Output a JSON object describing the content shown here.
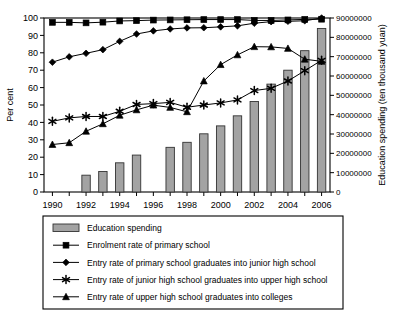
{
  "chart_data": {
    "type": "bar",
    "title": "",
    "subtitle": "",
    "xlabel": "",
    "ylabel": "Per cent",
    "y2label": "Education spending (ten thousand yuan)",
    "grid": false,
    "legend_position": "below",
    "x": [
      1990,
      1991,
      1992,
      1993,
      1994,
      1995,
      1996,
      1997,
      1998,
      1999,
      2000,
      2001,
      2002,
      2003,
      2004,
      2005,
      2006
    ],
    "xtick_labels": [
      "1990",
      "1992",
      "1994",
      "1996",
      "1998",
      "2000",
      "2002",
      "2004",
      "2006"
    ],
    "xticks": [
      1990,
      1992,
      1994,
      1996,
      1998,
      2000,
      2002,
      2004,
      2006
    ],
    "ylim": [
      0,
      100
    ],
    "yticks": [
      0,
      10,
      20,
      30,
      40,
      50,
      60,
      70,
      80,
      90,
      100
    ],
    "ytick_labels": [
      "0",
      "10",
      "20",
      "30",
      "40",
      "50",
      "60",
      "70",
      "80",
      "90",
      "100"
    ],
    "y2lim": [
      0,
      90000000
    ],
    "y2ticks": [
      0,
      10000000,
      20000000,
      30000000,
      40000000,
      50000000,
      60000000,
      70000000,
      80000000,
      90000000
    ],
    "y2tick_labels": [
      "0",
      "10000000",
      "20000000",
      "30000000",
      "40000000",
      "50000000",
      "60000000",
      "70000000",
      "80000000",
      "90000000"
    ],
    "bar_series": {
      "name": "Education spending",
      "axis": "right",
      "units": "ten thousand yuan",
      "color": "#a3a3a3",
      "edge_color": "#333333",
      "values": [
        null,
        null,
        8700000,
        10600000,
        15100000,
        19100000,
        null,
        23100000,
        25700000,
        30100000,
        34200000,
        39400000,
        46800000,
        55800000,
        63000000,
        73100000,
        84600000
      ]
    },
    "series": [
      {
        "name": "Enrolment rate of primary school",
        "marker": "square",
        "axis": "left",
        "values": [
          97.5,
          97.5,
          97.2,
          97.6,
          98.3,
          98.5,
          98.8,
          98.9,
          99.0,
          99.1,
          99.1,
          99.1,
          98.6,
          98.6,
          98.9,
          99.2,
          99.3
        ]
      },
      {
        "name": "Entry rate of primary school graduates into junior high school",
        "marker": "diamond",
        "axis": "left",
        "values": [
          74.6,
          77.7,
          79.7,
          81.8,
          86.6,
          90.8,
          92.6,
          93.7,
          94.3,
          94.4,
          94.9,
          95.5,
          97.0,
          97.9,
          98.1,
          98.4,
          100.0
        ]
      },
      {
        "name": "Entry rate of junior high school graduates into upper high school",
        "marker": "star",
        "axis": "left",
        "values": [
          40.6,
          42.6,
          43.4,
          43.4,
          46.4,
          50.3,
          50.8,
          51.5,
          48.7,
          50.0,
          51.2,
          52.9,
          58.3,
          59.6,
          63.8,
          69.7,
          75.7
        ]
      },
      {
        "name": "Entry rate of upper high school graduates into colleges",
        "marker": "triangle",
        "axis": "left",
        "values": [
          27.3,
          28.3,
          34.9,
          39.2,
          44.1,
          47.2,
          49.9,
          48.6,
          46.1,
          63.8,
          73.2,
          78.8,
          83.5,
          83.4,
          82.5,
          76.3,
          75.1
        ]
      }
    ]
  },
  "legend": {
    "items": [
      {
        "label": "Education spending",
        "marker": "bar-swatch"
      },
      {
        "label": "Enrolment rate of primary school",
        "marker": "square"
      },
      {
        "label": "Entry rate of primary school graduates into junior high school",
        "marker": "diamond"
      },
      {
        "label": "Entry rate of junior high school graduates into upper high school",
        "marker": "star"
      },
      {
        "label": "Entry rate of upper high school graduates into colleges",
        "marker": "triangle"
      }
    ]
  }
}
